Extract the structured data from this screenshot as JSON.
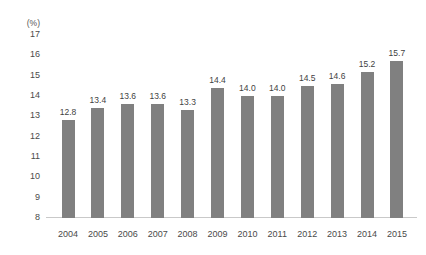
{
  "chart_data": {
    "type": "bar",
    "title": "",
    "subtitle": "",
    "xlabel": "",
    "ylabel": "",
    "unit_label": "(%)",
    "categories": [
      "2004",
      "2005",
      "2006",
      "2007",
      "2008",
      "2009",
      "2010",
      "2011",
      "2012",
      "2013",
      "2014",
      "2015"
    ],
    "values": [
      12.8,
      13.4,
      13.6,
      13.6,
      13.3,
      14.4,
      14.0,
      14.0,
      14.5,
      14.6,
      15.2,
      15.7
    ],
    "value_labels": [
      "12.8",
      "13.4",
      "13.6",
      "13.6",
      "13.3",
      "14.4",
      "14.0",
      "14.0",
      "14.5",
      "14.6",
      "15.2",
      "15.7"
    ],
    "ylim": [
      8,
      17
    ],
    "y_ticks": [
      17,
      16,
      15,
      14,
      13,
      12,
      11,
      10,
      9,
      8
    ],
    "y_tick_labels": [
      "17",
      "16",
      "15",
      "14",
      "13",
      "12",
      "11",
      "10",
      "9",
      "8"
    ],
    "grid": false,
    "legend": null,
    "bar_color": "#808080",
    "axis_color": "#c9c9c9",
    "text_color": "#3f3f3f"
  }
}
